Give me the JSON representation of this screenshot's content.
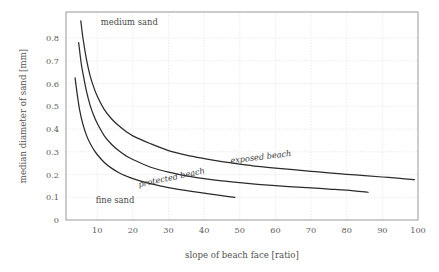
{
  "chart_data": {
    "type": "line",
    "title": "",
    "xlabel": "slope of beach face [ratio]",
    "ylabel": "median diameter of sand [mm]",
    "xlim": [
      1.3,
      101
    ],
    "ylim": [
      0,
      0.9
    ],
    "grid": true,
    "legend_position": "inline-curve-labels",
    "xticks": [
      10,
      20,
      30,
      40,
      50,
      60,
      70,
      80,
      90,
      100
    ],
    "xtick_labels": [
      "10",
      "20",
      "30",
      "40",
      "50",
      "60",
      "70",
      "80",
      "90",
      "100"
    ],
    "yticks": [
      0,
      0.1,
      0.2,
      0.3,
      0.4,
      0.5,
      0.6,
      0.7,
      0.8
    ],
    "ytick_labels": [
      "0",
      "0.1",
      "0.2",
      "0.3",
      "0.4",
      "0.5",
      "0.6",
      "0.7",
      "0.8"
    ],
    "series": [
      {
        "name": "exposed beach",
        "label": "exposed beach",
        "x": [
          5.4,
          6,
          7,
          8,
          9,
          10,
          12,
          14,
          16,
          18,
          20,
          25,
          30,
          35,
          40,
          45,
          50,
          55,
          60,
          65,
          70,
          75,
          80,
          85,
          90,
          95,
          99
        ],
        "y": [
          0.875,
          0.8,
          0.705,
          0.635,
          0.585,
          0.545,
          0.485,
          0.445,
          0.415,
          0.39,
          0.37,
          0.335,
          0.305,
          0.285,
          0.27,
          0.257,
          0.246,
          0.236,
          0.228,
          0.221,
          0.214,
          0.207,
          0.201,
          0.195,
          0.189,
          0.183,
          0.177
        ]
      },
      {
        "name": "protected beach",
        "label": "protected beach",
        "x": [
          4.8,
          5.5,
          6,
          7,
          8,
          9,
          10,
          12,
          14,
          16,
          18,
          20,
          25,
          30,
          35,
          40,
          45,
          50,
          55,
          60,
          65,
          70,
          75,
          80,
          86
        ],
        "y": [
          0.78,
          0.69,
          0.645,
          0.565,
          0.505,
          0.46,
          0.425,
          0.37,
          0.333,
          0.305,
          0.283,
          0.266,
          0.232,
          0.21,
          0.194,
          0.182,
          0.172,
          0.164,
          0.157,
          0.151,
          0.146,
          0.141,
          0.136,
          0.131,
          0.122
        ]
      },
      {
        "name": "fine sand boundary",
        "label": "",
        "x": [
          3.8,
          4.2,
          5,
          6,
          7,
          8,
          9,
          10,
          12,
          14,
          16,
          18,
          20,
          24,
          28,
          32,
          36,
          40,
          44,
          48.6
        ],
        "y": [
          0.625,
          0.575,
          0.49,
          0.42,
          0.372,
          0.337,
          0.31,
          0.288,
          0.253,
          0.228,
          0.209,
          0.194,
          0.182,
          0.163,
          0.149,
          0.137,
          0.127,
          0.118,
          0.109,
          0.099
        ]
      }
    ],
    "annotations": [
      {
        "text": "medium sand",
        "x": 19,
        "y": 0.855
      },
      {
        "text": "fine sand",
        "x": 15,
        "y": 0.075
      },
      {
        "text": "exposed beach",
        "x": 56,
        "y": 0.265,
        "italic": true,
        "rotation": -7
      },
      {
        "text": "protected beach",
        "x": 31,
        "y": 0.175,
        "italic": true,
        "rotation": -12
      }
    ]
  },
  "axes": {
    "x_title": "slope of beach face [ratio]",
    "y_title": "median diameter of sand [mm]"
  },
  "colors": {
    "curve": "#2b2b2b",
    "grid": "#d8d8d8",
    "frame": "#8e8e8e",
    "text": "#4a4a4a",
    "background": "#ffffff"
  }
}
